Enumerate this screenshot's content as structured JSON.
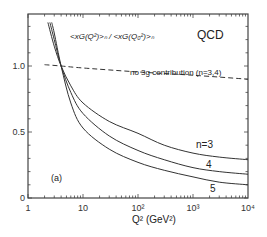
{
  "chart_data": {
    "type": "line",
    "title": "QCD",
    "subtitle": "<xG(Q²)>ₙ / <xG(Q₀²)>ₙ",
    "panel_label": "(a)",
    "xlabel": "Q² (GeV²)",
    "ylabel": "",
    "xscale": "log",
    "xlim": [
      1,
      10000
    ],
    "ylim": [
      0,
      1.35
    ],
    "x_ticks": [
      {
        "value": 1,
        "label": "1"
      },
      {
        "value": 10,
        "label": "10"
      },
      {
        "value": 100,
        "label": "10²"
      },
      {
        "value": 1000,
        "label": "10³"
      },
      {
        "value": 10000,
        "label": "10⁴"
      }
    ],
    "y_ticks": [
      {
        "value": 0,
        "label": "0"
      },
      {
        "value": 0.5,
        "label": "0.5"
      },
      {
        "value": 1.0,
        "label": "1.0"
      }
    ],
    "grid": false,
    "series": [
      {
        "name": "n=3",
        "label": "n=3",
        "style": "solid",
        "x": [
          2.3,
          3,
          4,
          6,
          10,
          30,
          100,
          300,
          1000,
          3000,
          10000
        ],
        "values": [
          1.33,
          1.15,
          1.0,
          0.85,
          0.72,
          0.58,
          0.49,
          0.4,
          0.34,
          0.31,
          0.29
        ]
      },
      {
        "name": "n=4",
        "label": "4",
        "style": "solid",
        "x": [
          2.5,
          3,
          4,
          6,
          10,
          30,
          100,
          300,
          1000,
          3000,
          10000
        ],
        "values": [
          1.33,
          1.2,
          1.0,
          0.8,
          0.64,
          0.47,
          0.36,
          0.29,
          0.23,
          0.2,
          0.18
        ]
      },
      {
        "name": "n=5",
        "label": "5",
        "style": "solid",
        "x": [
          2.7,
          3,
          4,
          6,
          10,
          30,
          100,
          300,
          1000,
          3000,
          10000
        ],
        "values": [
          1.33,
          1.25,
          1.0,
          0.72,
          0.53,
          0.37,
          0.27,
          0.21,
          0.16,
          0.12,
          0.1
        ]
      },
      {
        "name": "no 3g contribution (n=3,4)",
        "label": "no 3g contribution (n=3,4)",
        "style": "dashed",
        "x": [
          2,
          4,
          10,
          100,
          1000,
          10000
        ],
        "values": [
          1.01,
          1.0,
          0.985,
          0.955,
          0.93,
          0.9
        ]
      }
    ]
  }
}
